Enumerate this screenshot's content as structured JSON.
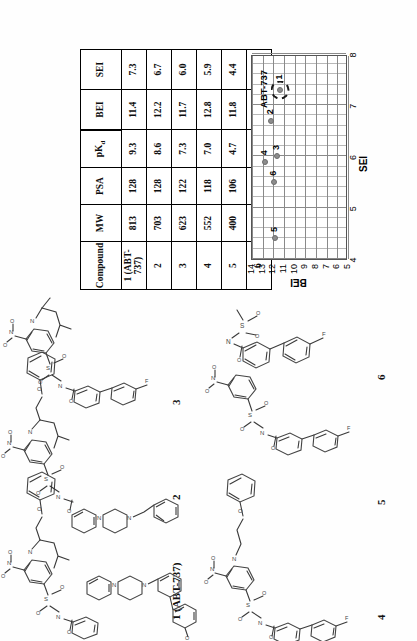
{
  "table": {
    "headers": [
      "Compound",
      "MW",
      "PSA",
      "pKd",
      "BEI",
      "SEI"
    ],
    "header_pkd_base": "pK",
    "header_pkd_sub": "d",
    "rows": [
      {
        "compound": "1 (ABT-737)",
        "mw": "813",
        "psa": "128",
        "pkd": "9.3",
        "bei": "11.4",
        "sei": "7.3"
      },
      {
        "compound": "2",
        "mw": "703",
        "psa": "128",
        "pkd": "8.6",
        "bei": "12.2",
        "sei": "6.7"
      },
      {
        "compound": "3",
        "mw": "623",
        "psa": "122",
        "pkd": "7.3",
        "bei": "11.7",
        "sei": "6.0"
      },
      {
        "compound": "4",
        "mw": "552",
        "psa": "118",
        "pkd": "7.0",
        "bei": "12.8",
        "sei": "5.9"
      },
      {
        "compound": "5",
        "mw": "400",
        "psa": "106",
        "pkd": "4.7",
        "bei": "11.8",
        "sei": "4.4"
      },
      {
        "compound": "6",
        "mw": "293",
        "psa": "63",
        "pkd": "3.5",
        "bei": "11.9",
        "sei": "5.5"
      }
    ]
  },
  "chart_data": {
    "type": "scatter",
    "title": "",
    "xlabel": "SEI",
    "ylabel": "BEI",
    "xlim": [
      4,
      8
    ],
    "ylim": [
      5,
      14
    ],
    "xticks": [
      "4",
      "5",
      "6",
      "7",
      "8"
    ],
    "yticks": [
      "5",
      "6",
      "7",
      "8",
      "9",
      "10",
      "11",
      "12",
      "13",
      "14"
    ],
    "grid": "major and minor vertical, major horizontal",
    "annotations": [
      {
        "text": "ABT-737",
        "x": 7.3,
        "y": 12.9
      }
    ],
    "points": [
      {
        "label": "1",
        "x": 7.3,
        "y": 11.4,
        "highlight": true
      },
      {
        "label": "2",
        "x": 6.7,
        "y": 12.2,
        "highlight": false
      },
      {
        "label": "3",
        "x": 6.0,
        "y": 11.7,
        "highlight": false
      },
      {
        "label": "4",
        "x": 5.9,
        "y": 12.8,
        "highlight": false
      },
      {
        "label": "5",
        "x": 4.4,
        "y": 11.8,
        "highlight": false
      },
      {
        "label": "6",
        "x": 5.5,
        "y": 11.9,
        "highlight": false
      }
    ]
  },
  "structures": {
    "s1": {
      "label": "1 (ABT-737)"
    },
    "s2": {
      "label": "2"
    },
    "s3": {
      "label": "3"
    },
    "s4": {
      "label": "4"
    },
    "s5": {
      "label": "5"
    },
    "s6": {
      "label": "6"
    },
    "atoms": {
      "n": "N",
      "o": "O",
      "s": "S",
      "f": "F",
      "h": "H"
    }
  }
}
